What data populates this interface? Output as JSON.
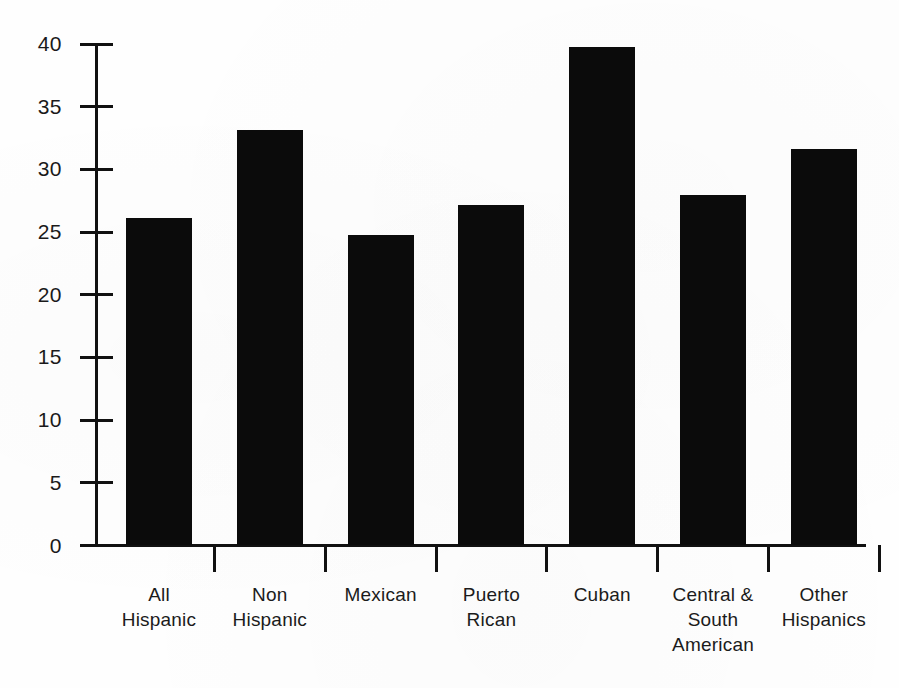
{
  "chart_data": {
    "type": "bar",
    "title": "",
    "subtitle": "",
    "xlabel": "",
    "ylabel": "",
    "categories": [
      "All Hispanic",
      "Non Hispanic",
      "Mexican",
      "Puerto Rican",
      "Cuban",
      "Central & South American",
      "Other Hispanics"
    ],
    "category_lines": [
      [
        "All",
        "Hispanic"
      ],
      [
        "Non",
        "Hispanic"
      ],
      [
        "Mexican"
      ],
      [
        "Puerto",
        "Rican"
      ],
      [
        "Cuban"
      ],
      [
        "Central &",
        "South",
        "American"
      ],
      [
        "Other",
        "Hispanics"
      ]
    ],
    "values": [
      26.1,
      33.1,
      24.7,
      27.1,
      39.7,
      27.9,
      31.6
    ],
    "ylim": [
      0,
      40
    ],
    "ytick_values": [
      0,
      5,
      10,
      15,
      20,
      25,
      30,
      35,
      40
    ],
    "ytick_labels": [
      "0",
      "5",
      "10",
      "15",
      "20",
      "25",
      "30",
      "35",
      "40"
    ],
    "grid": false,
    "legend": false,
    "legend_position": "none",
    "bar_color": "#0b0b0b",
    "axis_color": "#111111",
    "background_color": "#fefefe"
  }
}
